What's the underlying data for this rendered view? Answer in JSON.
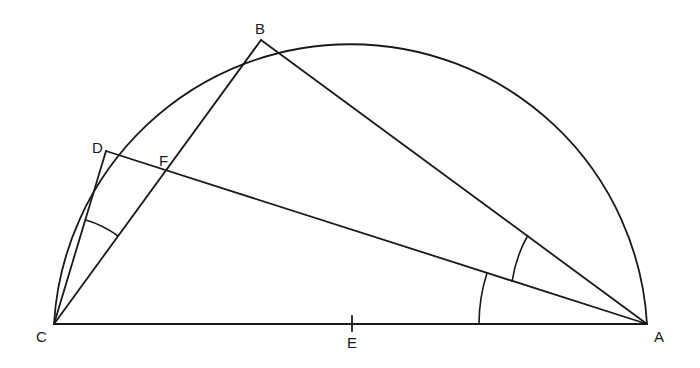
{
  "diagram": {
    "type": "geometry",
    "points": {
      "A": {
        "label": "A",
        "x": 647,
        "y": 324
      },
      "B": {
        "label": "B",
        "x": 261,
        "y": 40
      },
      "C": {
        "label": "C",
        "x": 54,
        "y": 324
      },
      "D": {
        "label": "D",
        "x": 106,
        "y": 151
      },
      "E": {
        "label": "E",
        "x": 351,
        "y": 324
      },
      "F": {
        "label": "F",
        "x": 167,
        "y": 172
      }
    },
    "segments": [
      [
        "C",
        "A"
      ],
      [
        "C",
        "B"
      ],
      [
        "B",
        "A"
      ],
      [
        "C",
        "D"
      ],
      [
        "D",
        "A"
      ]
    ],
    "semicircle": {
      "center": "E",
      "radius": 297,
      "from": "C",
      "to": "A"
    },
    "angle_marks": [
      {
        "vertex": "C",
        "between": [
          "D",
          "B"
        ]
      },
      {
        "vertex": "A",
        "between": [
          "C",
          "D"
        ]
      },
      {
        "vertex": "A",
        "between": [
          "D",
          "B"
        ]
      }
    ],
    "tick_marks": [
      {
        "at": "E",
        "on": [
          "C",
          "A"
        ]
      }
    ]
  },
  "labels": {
    "A": "A",
    "B": "B",
    "C": "C",
    "D": "D",
    "E": "E",
    "F": "F"
  }
}
